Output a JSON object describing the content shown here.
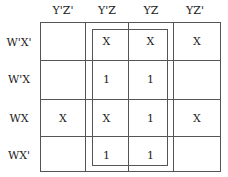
{
  "kmap": {
    "columns": [
      "Y'Z'",
      "Y'Z",
      "YZ",
      "YZ'"
    ],
    "rows": [
      {
        "label": "W'X'",
        "cells": [
          "",
          "X",
          "X",
          "X"
        ]
      },
      {
        "label": "W'X",
        "cells": [
          "",
          "1",
          "1",
          ""
        ]
      },
      {
        "label": "WX",
        "cells": [
          "X",
          "X",
          "1",
          "X"
        ]
      },
      {
        "label": "WX'",
        "cells": [
          "",
          "1",
          "1",
          ""
        ]
      }
    ],
    "groups": [
      {
        "name": "middle-columns-group",
        "columns": [
          "Y'Z",
          "YZ"
        ],
        "rows": [
          "W'X'",
          "W'X",
          "WX",
          "WX'"
        ]
      }
    ]
  }
}
